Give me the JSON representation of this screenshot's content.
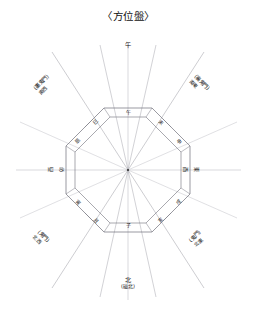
{
  "title": "〈方位盤〉",
  "colors": {
    "ink": "#1a1a1a",
    "line": "#8a8a93",
    "thin_line": "#b3b3bb",
    "background": "#ffffff"
  },
  "cardinal": {
    "north": {
      "main": "北",
      "paren": "(磁北)",
      "position": "bottom"
    },
    "south": {
      "main": "午",
      "paren": "",
      "position": "top"
    },
    "east_outer": {
      "main": "東",
      "paren": "",
      "position": "right"
    },
    "west_outer": {
      "main": "西",
      "paren": "",
      "position": "left"
    }
  },
  "center_labels": {
    "top": "午",
    "bottom": "子",
    "left_inner": "酉",
    "left_outer": "西",
    "right_inner": "卯",
    "right_outer": "東"
  },
  "ring_characters": [
    {
      "id": "uma",
      "char": "午",
      "angle": 0,
      "note": "top center"
    },
    {
      "id": "hitsuji",
      "char": "未",
      "angle": -45,
      "note": "upper right inner"
    },
    {
      "id": "saru",
      "char": "申",
      "angle": -45,
      "note": "upper right outer"
    },
    {
      "id": "tori",
      "char": "酉",
      "angle": -90,
      "note": "right inner"
    },
    {
      "id": "higashi",
      "char": "東",
      "angle": -90,
      "note": "right outer"
    },
    {
      "id": "inu",
      "char": "戌",
      "angle": -135,
      "note": "lower right inner"
    },
    {
      "id": "i",
      "char": "亥",
      "angle": -135,
      "note": "lower right outer"
    },
    {
      "id": "ne",
      "char": "子",
      "angle": 180,
      "note": "bottom center"
    },
    {
      "id": "ushi",
      "char": "丑",
      "angle": 135,
      "note": "lower left inner"
    },
    {
      "id": "tora",
      "char": "寅",
      "angle": 135,
      "note": "lower left outer"
    },
    {
      "id": "u",
      "char": "卯",
      "angle": 90,
      "note": "left inner"
    },
    {
      "id": "nishi",
      "char": "西",
      "angle": 90,
      "note": "left outer"
    },
    {
      "id": "tatsu",
      "char": "辰",
      "angle": 45,
      "note": "upper left inner"
    },
    {
      "id": "mi",
      "char": "巳",
      "angle": 45,
      "note": "upper left outer"
    }
  ],
  "diagonal_labels": [
    {
      "id": "ne-ushi-tora",
      "line1": "(裏鬼門)",
      "line2": "南西",
      "corner": "top-left",
      "rotation": -45
    },
    {
      "id": "hitsuji-saru",
      "line1": "(裏鬼門)",
      "line2": "南東",
      "corner": "top-right",
      "rotation": 45
    },
    {
      "id": "tatsu-mi",
      "line1": "(鬼門)",
      "line2": "北西",
      "corner": "bottom-left",
      "rotation": 45
    },
    {
      "id": "inu-i",
      "line1": "(鬼門)",
      "line2": "北東",
      "corner": "bottom-right",
      "rotation": -45
    }
  ],
  "geometry": {
    "center_x": 128,
    "center_y": 170,
    "inner_radius": 52,
    "outer_radius": 62,
    "sides": 8,
    "spoke_count": 12,
    "axis_extension": 85
  }
}
